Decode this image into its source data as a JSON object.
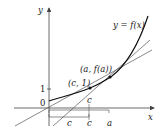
{
  "diagram": {
    "axes": {
      "x_label": "x",
      "y_label": "y"
    },
    "ticks": {
      "origin": "0",
      "y_one": "1"
    },
    "curve_label": "y = f(x)",
    "points": [
      {
        "label": "(c, 1)"
      },
      {
        "label": "(a, f(a))"
      }
    ],
    "brackets": {
      "upper_c": "c",
      "lower_c_left": "c",
      "lower_c_right": "c",
      "a": "a"
    },
    "colors": {
      "curve": "#111111",
      "lines": "#555555",
      "axes": "#444444"
    }
  }
}
